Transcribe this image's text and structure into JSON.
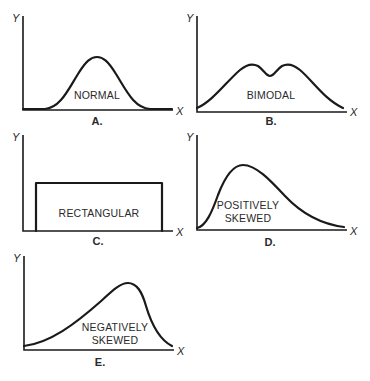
{
  "axis_labels": {
    "y": "Y",
    "x": "X"
  },
  "panels": [
    {
      "id": "A",
      "caption": "A.",
      "shape": "normal",
      "label_lines": [
        "NORMAL"
      ]
    },
    {
      "id": "B",
      "caption": "B.",
      "shape": "bimodal",
      "label_lines": [
        "BIMODAL"
      ]
    },
    {
      "id": "C",
      "caption": "C.",
      "shape": "rectangular",
      "label_lines": [
        "RECTANGULAR"
      ]
    },
    {
      "id": "D",
      "caption": "D.",
      "shape": "positively-skewed",
      "label_lines": [
        "POSITIVELY",
        "SKEWED"
      ]
    },
    {
      "id": "E",
      "caption": "E.",
      "shape": "negatively-skewed",
      "label_lines": [
        "NEGATIVELY",
        "SKEWED"
      ]
    }
  ],
  "colors": {
    "ink": "#1a1a1a",
    "background": "#ffffff"
  }
}
